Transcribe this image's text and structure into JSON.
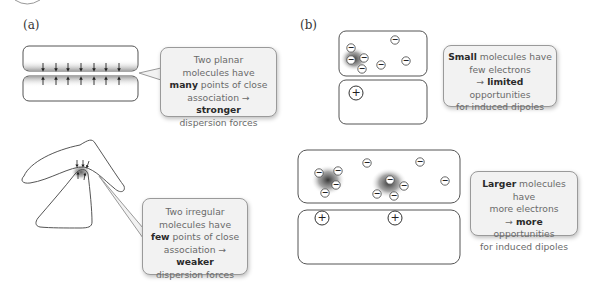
{
  "panels": {
    "a": {
      "label": "(a)",
      "callouts": [
        {
          "id": "planar",
          "line1": "Two planar",
          "line2": "molecules have",
          "line3_bold": "many",
          "line3_rest": " points of close",
          "line4_pre": "association → ",
          "line4_bold": "stronger",
          "line5": "dispersion forces"
        },
        {
          "id": "irregular",
          "line1": "Two irregular",
          "line2": "molecules have",
          "line3_bold": "few",
          "line3_rest": " points of close",
          "line4_pre": "association → ",
          "line4_bold": "weaker",
          "line5": "dispersion forces"
        }
      ]
    },
    "b": {
      "label": "(b)",
      "callouts": [
        {
          "id": "small",
          "line1_bold": "Small",
          "line1_rest": " molecules have",
          "line2": "few electrons",
          "line3_pre": "→ ",
          "line3_bold": "limited",
          "line3_rest": " opportunities",
          "line4": "for induced dipoles"
        },
        {
          "id": "larger",
          "line1_bold": "Larger",
          "line1_rest": " molecules have",
          "line2": "more electrons",
          "line3_pre": "→ ",
          "line3_bold": "more",
          "line3_rest": " opportunities",
          "line4": "for induced dipoles"
        }
      ],
      "symbols": {
        "electron": "−",
        "nucleus": "+"
      }
    }
  },
  "colors": {
    "outline": "#555555",
    "callout_bg": "#f2f2f2",
    "callout_border": "#9a9a9a",
    "shade": "#3a3a3a"
  }
}
